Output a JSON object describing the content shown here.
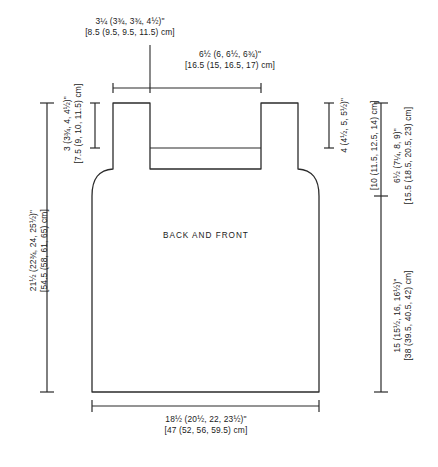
{
  "diagram": {
    "piece_label": "BACK AND FRONT",
    "line_color": "#2b2b2b",
    "text_color": "#1a1a1a",
    "background": "#ffffff"
  },
  "measurements": {
    "shoulder_strap": {
      "imperial": "3¼ (3¾, 3¾, 4½)\"",
      "metric": "[8.5 (9.5, 9.5, 11.5) cm]",
      "position": "top-left"
    },
    "neck_width": {
      "imperial": "6½ (6, 6½, 6¾)\"",
      "metric": "[16.5 (15, 16.5, 17) cm]",
      "position": "top-center"
    },
    "neck_depth": {
      "imperial": "3 (3¾, 4, 4½)\"",
      "metric": "[7.5 (9, 10, 11.5) cm]",
      "position": "inner-left-vertical"
    },
    "total_length": {
      "imperial": "21½ (22¾, 24, 25½)\"",
      "metric": "[54.5 (58, 61, 65) cm]",
      "position": "far-left-vertical"
    },
    "armhole_upper": {
      "imperial": "4 (4½, 5, 5½)\"",
      "metric": "",
      "position": "inner-right-vertical"
    },
    "armhole_depth_metric": {
      "imperial": "",
      "metric": "[10 (11.5, 12.5, 14) cm]",
      "position": "inner-right-vertical-2"
    },
    "armhole_total": {
      "imperial": "6½ (7¼, 8, 9)\"",
      "metric": "[15.5 (18.5, 20.5, 23) cm]",
      "position": "right-vertical-upper"
    },
    "body_length": {
      "imperial": "15 (15½, 16, 16½)\"",
      "metric": "[38 (39.5, 40.5, 42) cm]",
      "position": "right-vertical-lower"
    },
    "bottom_width": {
      "imperial": "18½ (20½, 22, 23½)\"",
      "metric": "[47 (52, 56, 59.5) cm]",
      "position": "bottom-center"
    }
  }
}
